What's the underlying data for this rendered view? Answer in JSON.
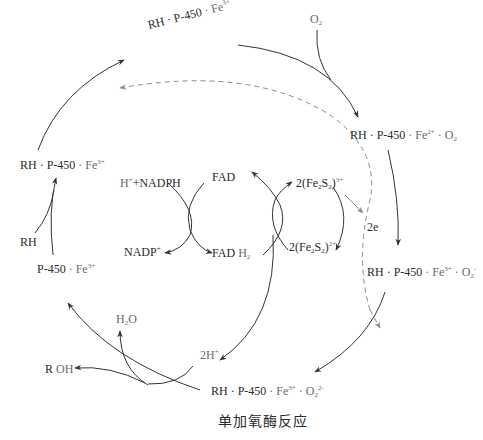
{
  "caption": "单加氧酶反应",
  "nodes": {
    "top": {
      "rh": "RH · ",
      "p450": "P-450",
      "fe": " · Fe",
      "sup": "3+"
    },
    "o2": {
      "o": "O",
      "sub": "2"
    },
    "right1": {
      "rh": "RH · ",
      "p450": "P-450",
      "fe": " · Fe",
      "sup": "2+",
      "tail": " · O",
      "sub": "2"
    },
    "right2": {
      "rh": "RH · ",
      "p450": "P-450",
      "fe": " · Fe",
      "sup": "3+",
      "tail": " · O",
      "sub": "2",
      "sup2": "-"
    },
    "bottom": {
      "rh": "RH · ",
      "p450": "P-450",
      "fe": " · Fe",
      "sup": "3+",
      "tail": " · O",
      "sub": "2",
      "sup2": "2-"
    },
    "left_rh": {
      "rh": "RH · ",
      "p450": "P-450",
      "fe": " · Fe",
      "sup": "3+"
    },
    "rh": "RH",
    "left_p450": {
      "p450": "P-450",
      "fe": " · Fe",
      "sup": "3+"
    },
    "h2o": {
      "h": "H",
      "sub": "2",
      "o": "O"
    },
    "roh": {
      "r": "R ",
      "oh": "OH"
    },
    "two_h": {
      "text": "2H",
      "sup": "+"
    }
  },
  "electron_chain": {
    "nadph": {
      "h": "H",
      "sup": "+",
      "text": "+NADPH"
    },
    "nadp": {
      "text": "NADP",
      "sup": "+"
    },
    "fad": "FAD",
    "fadh2": {
      "fad": "FAD ",
      "h": "H",
      "sub": "2"
    },
    "fes_ox": {
      "pre": "2(Fe",
      "sub1": "2",
      "mid": "S",
      "sub2": "2",
      "post": ")",
      "sup": "3+"
    },
    "fes_red": {
      "pre": "2(Fe",
      "sub1": "2",
      "mid": "S",
      "sub2": "2",
      "post": ")",
      "sup": "2+"
    },
    "two_e": "2e"
  },
  "colors": {
    "solid_arrow": "#333333",
    "dashed_arrow": "#8a8a8a",
    "text": "#2a2a2a",
    "grey_text": "#6a6a6a"
  }
}
